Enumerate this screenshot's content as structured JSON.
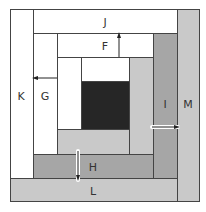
{
  "diagram": {
    "type": "log-cabin-quilt-block",
    "colors": {
      "white": "#ffffff",
      "light_gray": "#c9c9c9",
      "medium_gray": "#a6a6a6",
      "center": "#262626",
      "border": "#444444"
    },
    "pieces": {
      "F": "F",
      "G": "G",
      "H": "H",
      "I": "I",
      "J": "J",
      "K": "K",
      "L": "L",
      "M": "M"
    }
  }
}
